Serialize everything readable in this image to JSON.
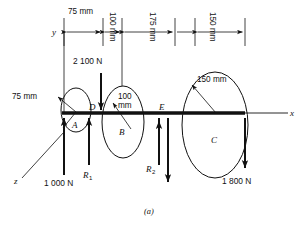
{
  "figure": {
    "caption": "(a)",
    "axes": [
      {
        "name": "y",
        "label": "y"
      },
      {
        "name": "x",
        "label": "x"
      },
      {
        "name": "z",
        "label": "z"
      }
    ],
    "dimensions": [
      {
        "id": "d1",
        "label": "75 mm",
        "orientation": "horizontal"
      },
      {
        "id": "d2",
        "label": "100 mm",
        "orientation": "vertical"
      },
      {
        "id": "d3",
        "label": "175 mm",
        "orientation": "vertical"
      },
      {
        "id": "d4",
        "label": "150 mm",
        "orientation": "vertical"
      }
    ],
    "radii": [
      {
        "id": "rA",
        "label": "75 mm",
        "part": "A"
      },
      {
        "id": "rB",
        "label": "100",
        "label2": "mm",
        "part": "B"
      },
      {
        "id": "rC",
        "label": "150 mm",
        "part": "C"
      }
    ],
    "parts": [
      {
        "id": "A",
        "label": "A"
      },
      {
        "id": "B",
        "label": "B"
      },
      {
        "id": "C",
        "label": "C"
      }
    ],
    "points": [
      {
        "id": "D",
        "label": "D"
      },
      {
        "id": "E",
        "label": "E"
      }
    ],
    "forces": [
      {
        "id": "f1000",
        "label": "1 000 N",
        "direction": "up"
      },
      {
        "id": "f2100",
        "label": "2 100 N",
        "direction": "down"
      },
      {
        "id": "f1800",
        "label": "1 800 N",
        "direction": "down"
      }
    ],
    "reactions": [
      {
        "id": "R1",
        "base": "R",
        "sub": "1",
        "direction": "up"
      },
      {
        "id": "R2",
        "base": "R",
        "sub": "2",
        "direction": "down"
      }
    ],
    "colors": {
      "stroke": "#111111",
      "background": "#ffffff"
    }
  }
}
